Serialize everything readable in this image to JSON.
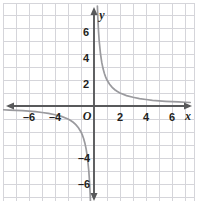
{
  "figure": {
    "title": "",
    "background_color": "#ffffff",
    "width": 198,
    "height": 218
  },
  "grid": {
    "line_color": "#c9c9cf",
    "minor_line_color": "#e4e4e8",
    "spacing_units": 1,
    "visible": true
  },
  "axes": {
    "axis_color": "#6d6e71",
    "x_axis_name": "x",
    "y_axis_name": "y",
    "origin_label": "O",
    "x_ticks": [
      {
        "value": -6,
        "label": "–6"
      },
      {
        "value": -4,
        "label": "–4"
      },
      {
        "value": 2,
        "label": "2"
      },
      {
        "value": 4,
        "label": "4"
      },
      {
        "value": 6,
        "label": "6"
      }
    ],
    "y_ticks": [
      {
        "value": 6,
        "label": "6"
      },
      {
        "value": 4,
        "label": "4"
      },
      {
        "value": 2,
        "label": "2"
      },
      {
        "value": -4,
        "label": "–4"
      },
      {
        "value": -6,
        "label": "–6"
      }
    ]
  },
  "chart_data": {
    "type": "line",
    "title": "",
    "xlabel": "x",
    "ylabel": "y",
    "xlim": [
      -7.2,
      7.7
    ],
    "ylim": [
      -7.5,
      8.1
    ],
    "grid": true,
    "legend": "none",
    "series": [
      {
        "name": "y = 2/x (right branch)",
        "curve_color": "#9a9a9e",
        "x": [
          0.26,
          0.3,
          0.35,
          0.4,
          0.5,
          0.6,
          0.7,
          0.8,
          0.9,
          1.0,
          1.2,
          1.4,
          1.6,
          1.8,
          2.0,
          2.5,
          3.0,
          3.5,
          4.0,
          4.5,
          5.0,
          5.5,
          6.0,
          6.5,
          7.0,
          7.4
        ],
        "y": [
          7.69,
          6.67,
          5.71,
          5.0,
          4.0,
          3.33,
          2.86,
          2.5,
          2.22,
          2.0,
          1.67,
          1.43,
          1.25,
          1.11,
          1.0,
          0.8,
          0.67,
          0.57,
          0.5,
          0.44,
          0.4,
          0.36,
          0.33,
          0.31,
          0.29,
          0.27
        ]
      },
      {
        "name": "y = 2/x (left branch)",
        "curve_color": "#9a9a9e",
        "x": [
          -0.27,
          -0.3,
          -0.35,
          -0.4,
          -0.5,
          -0.6,
          -0.7,
          -0.8,
          -0.9,
          -1.0,
          -1.2,
          -1.4,
          -1.6,
          -1.8,
          -2.0,
          -2.5,
          -3.0,
          -3.5,
          -4.0,
          -4.5,
          -5.0,
          -5.5,
          -6.0,
          -6.5,
          -7.0
        ],
        "y": [
          -7.41,
          -6.67,
          -5.71,
          -5.0,
          -4.0,
          -3.33,
          -2.86,
          -2.5,
          -2.22,
          -2.0,
          -1.67,
          -1.43,
          -1.25,
          -1.11,
          -1.0,
          -0.8,
          -0.67,
          -0.57,
          -0.5,
          -0.44,
          -0.4,
          -0.36,
          -0.33,
          -0.31,
          -0.29
        ]
      }
    ],
    "equation": "y = 2/x"
  }
}
